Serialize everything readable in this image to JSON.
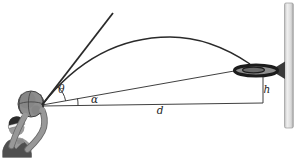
{
  "figure": {
    "kind": "physics-projectile-diagram",
    "labels": {
      "launch_angle": "θ",
      "sight_angle": "α",
      "horizontal_distance": "d",
      "rim_height": "h"
    },
    "elements": {
      "player": "basketball-player-shooting",
      "ball": "basketball-at-launch-point",
      "launch_line": "initial-velocity-direction-line",
      "trajectory": "parabolic-flight-arc-to-rim",
      "sight_line": "line-from-ball-to-rim",
      "baseline": "horizontal-distance-line",
      "height_line": "vertical-line-rim-to-baseline",
      "rim": "basketball-rim",
      "backboard": "backboard"
    },
    "colors": {
      "line": "#2a2a2a",
      "label": "#1d1d1d",
      "rim": "#1c1c1c",
      "rim_inner": "#8f8f8f",
      "bracket": "#3a3a3a",
      "backboard_edge": "#9a9a9a",
      "ball": "#8d8d8d",
      "ball_seam": "#474747",
      "skin": "#9a9a9a",
      "arm": "#989898",
      "jersey": "#4f4f4f",
      "hair": "#2b2b2b",
      "headband": "#f4f4f4",
      "background": "#ffffff"
    }
  }
}
